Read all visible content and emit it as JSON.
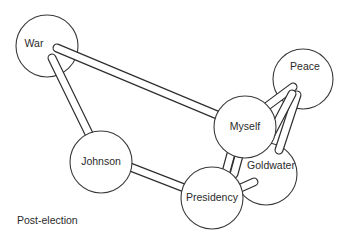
{
  "diagram": {
    "caption": "Post-election",
    "nodes": {
      "war": {
        "label": "War"
      },
      "peace": {
        "label": "Peace"
      },
      "myself": {
        "label": "Myself"
      },
      "johnson": {
        "label": "Johnson"
      },
      "goldwater": {
        "label": "Goldwater"
      },
      "presidency": {
        "label": "Presidency"
      }
    },
    "links": [
      {
        "from": "War",
        "to": "Myself"
      },
      {
        "from": "War",
        "to": "Johnson"
      },
      {
        "from": "Johnson",
        "to": "Presidency"
      },
      {
        "from": "Peace",
        "to": "Myself"
      },
      {
        "from": "Peace",
        "to": "Goldwater"
      },
      {
        "from": "Myself",
        "to": "Presidency"
      },
      {
        "from": "Myself",
        "to": "Presidency"
      },
      {
        "from": "Goldwater",
        "to": "Presidency"
      }
    ],
    "colors": {
      "stroke": "#2e2e2e",
      "fill": "#ffffff",
      "text": "#2a2a2a"
    }
  }
}
